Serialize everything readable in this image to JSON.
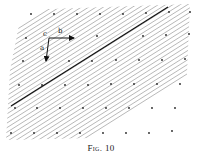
{
  "figure": {
    "caption": "Fig. 10",
    "caption_prefix": "Fig.",
    "caption_number": "10",
    "labels": {
      "a": "a",
      "b": "b",
      "c": "c"
    },
    "colors": {
      "hatch": "#9a9a9a",
      "dots": "#222222",
      "bold_line": "#111111",
      "arrows": "#111111"
    },
    "hatch": {
      "count": 34,
      "spacing": 4.6,
      "slope": 0.5
    },
    "lattice_dots": [
      [
        31,
        14
      ],
      [
        54,
        14
      ],
      [
        77,
        14
      ],
      [
        100,
        14
      ],
      [
        123,
        14
      ],
      [
        146,
        13
      ],
      [
        169,
        12
      ],
      [
        190,
        12
      ],
      [
        26,
        38
      ],
      [
        97,
        36
      ],
      [
        143,
        36
      ],
      [
        166,
        35
      ],
      [
        189,
        34
      ],
      [
        23,
        61
      ],
      [
        69,
        61
      ],
      [
        92,
        61
      ],
      [
        116,
        60
      ],
      [
        139,
        60
      ],
      [
        162,
        60
      ],
      [
        185,
        59
      ],
      [
        19,
        85
      ],
      [
        42,
        85
      ],
      [
        65,
        85
      ],
      [
        88,
        85
      ],
      [
        111,
        84
      ],
      [
        134,
        84
      ],
      [
        157,
        84
      ],
      [
        180,
        84
      ],
      [
        15,
        108
      ],
      [
        37,
        108
      ],
      [
        60,
        108
      ],
      [
        83,
        108
      ],
      [
        106,
        108
      ],
      [
        129,
        108
      ],
      [
        152,
        108
      ],
      [
        175,
        108
      ],
      [
        11,
        133
      ],
      [
        34,
        133
      ],
      [
        57,
        133
      ],
      [
        80,
        133
      ],
      [
        103,
        133
      ],
      [
        126,
        133
      ],
      [
        149,
        133
      ],
      [
        172,
        131
      ]
    ],
    "bold_line": {
      "x1": 11,
      "y1": 106,
      "x2": 168,
      "y2": 7
    },
    "origin": {
      "x": 49,
      "y": 38
    },
    "arrow_a_end": {
      "x": 46,
      "y": 61
    },
    "arrow_b_end": {
      "x": 74,
      "y": 38
    }
  }
}
